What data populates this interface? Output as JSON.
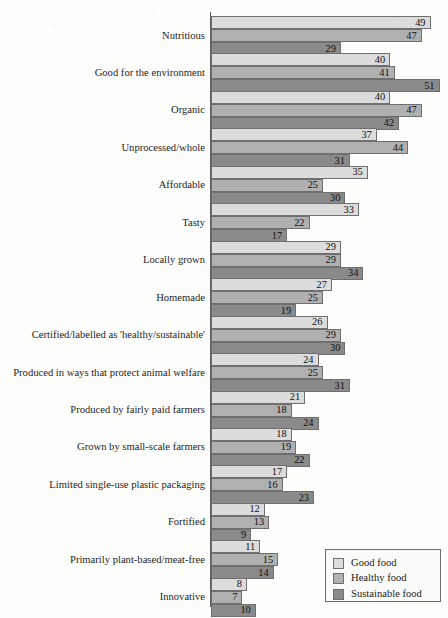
{
  "chart_data": {
    "type": "bar",
    "orientation": "horizontal",
    "title": "",
    "subtitle": "",
    "xlabel": "",
    "ylabel": "",
    "xlim": [
      0,
      52
    ],
    "grid": false,
    "legend_position": "bottom-right",
    "categories": [
      "Nutritious",
      "Good for the environment",
      "Organic",
      "Unprocessed/whole",
      "Affordable",
      "Tasty",
      "Locally grown",
      "Homemade",
      "Certified/labelled as 'healthy/sustainable'",
      "Produced in ways that protect animal welfare",
      "Produced by fairly paid farmers",
      "Grown by small-scale farmers",
      "Limited single-use plastic packaging",
      "Fortified",
      "Primarily plant-based/meat-free",
      "Innovative"
    ],
    "series": [
      {
        "name": "Good food",
        "color": "#dcdcdc",
        "values": [
          49,
          40,
          40,
          37,
          35,
          33,
          29,
          27,
          26,
          24,
          21,
          18,
          17,
          12,
          11,
          8
        ]
      },
      {
        "name": "Healthy food",
        "color": "#b0b0b0",
        "values": [
          47,
          41,
          47,
          44,
          25,
          22,
          29,
          25,
          29,
          25,
          18,
          19,
          16,
          13,
          15,
          7
        ]
      },
      {
        "name": "Sustainable food",
        "color": "#8a8a8a",
        "values": [
          29,
          51,
          42,
          31,
          30,
          17,
          34,
          19,
          30,
          31,
          24,
          22,
          23,
          9,
          14,
          10
        ]
      }
    ]
  },
  "legend": {
    "entries": [
      {
        "label": "Good food",
        "color": "#dcdcdc"
      },
      {
        "label": "Healthy food",
        "color": "#b0b0b0"
      },
      {
        "label": "Sustainable food",
        "color": "#8a8a8a"
      }
    ]
  }
}
